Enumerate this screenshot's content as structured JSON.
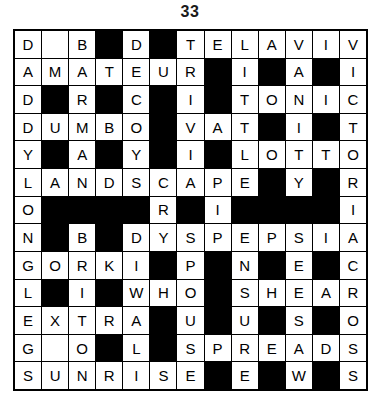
{
  "puzzle": {
    "title": "33",
    "rows": 13,
    "cols": 13,
    "colors": {
      "block": "#000000",
      "cell": "#ffffff",
      "text": "#000000",
      "border": "#000000"
    },
    "legend": {
      "block_symbol": "#",
      "empty_symbol": "",
      "letter": "A-Z"
    },
    "grid": [
      [
        "D",
        "",
        "B",
        "#",
        "D",
        "#",
        "T",
        "E",
        "L",
        "A",
        "V",
        "I",
        "V"
      ],
      [
        "A",
        "M",
        "A",
        "T",
        "E",
        "U",
        "R",
        "#",
        "I",
        "#",
        "A",
        "#",
        "I"
      ],
      [
        "D",
        "#",
        "R",
        "#",
        "C",
        "#",
        "I",
        "#",
        "T",
        "O",
        "N",
        "I",
        "C"
      ],
      [
        "D",
        "U",
        "M",
        "B",
        "O",
        "#",
        "V",
        "A",
        "T",
        "#",
        "I",
        "#",
        "T"
      ],
      [
        "Y",
        "#",
        "A",
        "#",
        "Y",
        "#",
        "I",
        "#",
        "L",
        "O",
        "T",
        "T",
        "O"
      ],
      [
        "L",
        "A",
        "N",
        "D",
        "S",
        "C",
        "A",
        "P",
        "E",
        "#",
        "Y",
        "#",
        "R"
      ],
      [
        "O",
        "#",
        "#",
        "#",
        "#",
        "R",
        "#",
        "I",
        "#",
        "#",
        "#",
        "#",
        "I"
      ],
      [
        "N",
        "#",
        "B",
        "#",
        "D",
        "Y",
        "S",
        "P",
        "E",
        "P",
        "S",
        "I",
        "A"
      ],
      [
        "G",
        "O",
        "R",
        "K",
        "I",
        "#",
        "P",
        "#",
        "N",
        "#",
        "E",
        "#",
        "C"
      ],
      [
        "L",
        "#",
        "I",
        "#",
        "W",
        "H",
        "O",
        "#",
        "S",
        "H",
        "E",
        "A",
        "R"
      ],
      [
        "E",
        "X",
        "T",
        "R",
        "A",
        "#",
        "U",
        "#",
        "U",
        "#",
        "S",
        "#",
        "O"
      ],
      [
        "G",
        "",
        "O",
        "#",
        "L",
        "#",
        "S",
        "P",
        "R",
        "E",
        "A",
        "D",
        "S"
      ],
      [
        "S",
        "U",
        "N",
        "R",
        "I",
        "S",
        "E",
        "#",
        "E",
        "#",
        "W",
        "#",
        "S"
      ]
    ],
    "across_words": [
      "TELAVIV",
      "AMATEUR",
      "TONIC",
      "DUMBO",
      "VAT",
      "LOTTO",
      "LANDSCAPE",
      "DYSPEPSIA",
      "GORKI",
      "WHO",
      "SHEAR",
      "EXTRA",
      "SPREADS",
      "SUNRISE"
    ],
    "down_words": [
      "DADDYLONGLEGS",
      "BRAMANBRITON",
      "DECOYS",
      "TRIVIA",
      "ELATE",
      "LITTORAL",
      "ANI",
      "VANITY",
      "ICICLE",
      "VICTORIACROSS",
      "PRESS",
      "HEAD",
      "SPUSEW"
    ]
  }
}
